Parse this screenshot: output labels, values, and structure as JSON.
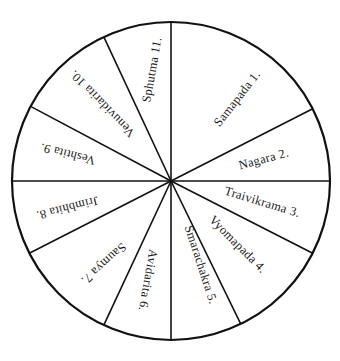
{
  "diagram": {
    "title": "",
    "center": [
      171,
      181
    ],
    "radius": 159,
    "stroke_color": "#111111",
    "spoke_angles_deg": [
      -90,
      -27,
      0,
      27,
      64,
      90,
      115,
      153,
      180,
      208,
      245
    ],
    "sectors": [
      {
        "number": 1,
        "name": "Samapada",
        "label": "Samapada  1.",
        "x": 238,
        "y": 99,
        "rotate": -52
      },
      {
        "number": 2,
        "name": "Nagara",
        "label": "Nagara  2.",
        "x": 264,
        "y": 160,
        "rotate": -15
      },
      {
        "number": 3,
        "name": "Traivikrama",
        "label": "Traivikrama  3.",
        "x": 262,
        "y": 203,
        "rotate": 17
      },
      {
        "number": 4,
        "name": "Vyomapada",
        "label": "Vyomapada  4.",
        "x": 237,
        "y": 245,
        "rotate": 45
      },
      {
        "number": 5,
        "name": "Smarachakra",
        "label": "Smarachakra  5.",
        "x": 200,
        "y": 265,
        "rotate": 72
      },
      {
        "number": 6,
        "name": "Avidarita",
        "label": "Avidarita  6.",
        "x": 147,
        "y": 280,
        "rotate": 100
      },
      {
        "number": 7,
        "name": "Saumya",
        "label": "Saumya  7.",
        "x": 103,
        "y": 263,
        "rotate": 138
      },
      {
        "number": 8,
        "name": "Jrimbhita",
        "label": "Jrimbhita  8.",
        "x": 67,
        "y": 207,
        "rotate": 166
      },
      {
        "number": 9,
        "name": "Veshtita",
        "label": "Veshtita  9.",
        "x": 68,
        "y": 153,
        "rotate": 194
      },
      {
        "number": 10,
        "name": "Venuvidarita",
        "label": "Venuvidarita  10.",
        "x": 103,
        "y": 103,
        "rotate": 226
      },
      {
        "number": 11,
        "name": "Sphutma",
        "label": "Sphutma  11.",
        "x": 153,
        "y": 70,
        "rotate": -80
      }
    ]
  }
}
